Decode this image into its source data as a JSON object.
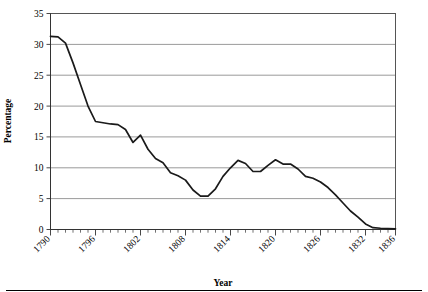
{
  "chart_data": {
    "type": "line",
    "title": "",
    "xlabel": "Year",
    "ylabel": "Percentage",
    "xlim": [
      1790,
      1836
    ],
    "ylim": [
      0,
      35
    ],
    "ytick_step": 5,
    "xtick_step": 6,
    "grid": "horizontal",
    "legend": "none",
    "x_tick_labels": [
      "1790",
      "1796",
      "1802",
      "1808",
      "1814",
      "1820",
      "1826",
      "1832",
      "1836"
    ],
    "y_tick_labels": [
      "0",
      "5",
      "10",
      "15",
      "20",
      "25",
      "30",
      "35"
    ],
    "x": [
      1790,
      1791,
      1792,
      1793,
      1794,
      1795,
      1796,
      1797,
      1798,
      1799,
      1800,
      1801,
      1802,
      1803,
      1804,
      1805,
      1806,
      1807,
      1808,
      1809,
      1810,
      1811,
      1812,
      1813,
      1814,
      1815,
      1816,
      1817,
      1818,
      1819,
      1820,
      1821,
      1822,
      1823,
      1824,
      1825,
      1826,
      1827,
      1828,
      1829,
      1830,
      1831,
      1832,
      1833,
      1834,
      1835,
      1836
    ],
    "values": [
      31.3,
      31.2,
      30.2,
      27.0,
      23.5,
      20.0,
      17.5,
      17.3,
      17.1,
      17.0,
      16.2,
      14.1,
      15.3,
      13.0,
      11.5,
      10.8,
      9.2,
      8.7,
      8.0,
      6.4,
      5.4,
      5.4,
      6.6,
      8.6,
      10.0,
      11.2,
      10.7,
      9.4,
      9.4,
      10.4,
      11.3,
      10.6,
      10.6,
      9.8,
      8.6,
      8.3,
      7.7,
      6.8,
      5.6,
      4.3,
      3.0,
      2.0,
      0.9,
      0.3,
      0.2,
      0.15,
      0.1
    ],
    "series": [
      {
        "name": "percentage-series",
        "color": "#1a1a1a",
        "values": [
          31.3,
          31.2,
          30.2,
          27.0,
          23.5,
          20.0,
          17.5,
          17.3,
          17.1,
          17.0,
          16.2,
          14.1,
          15.3,
          13.0,
          11.5,
          10.8,
          9.2,
          8.7,
          8.0,
          6.4,
          5.4,
          5.4,
          6.6,
          8.6,
          10.0,
          11.2,
          10.7,
          9.4,
          9.4,
          10.4,
          11.3,
          10.6,
          10.6,
          9.8,
          8.6,
          8.3,
          7.7,
          6.8,
          5.6,
          4.3,
          3.0,
          2.0,
          0.9,
          0.3,
          0.2,
          0.15,
          0.1
        ]
      }
    ]
  },
  "colors": {
    "line": "#1a1a1a",
    "grid": "#808080",
    "border": "#555555",
    "background": "#ffffff"
  }
}
